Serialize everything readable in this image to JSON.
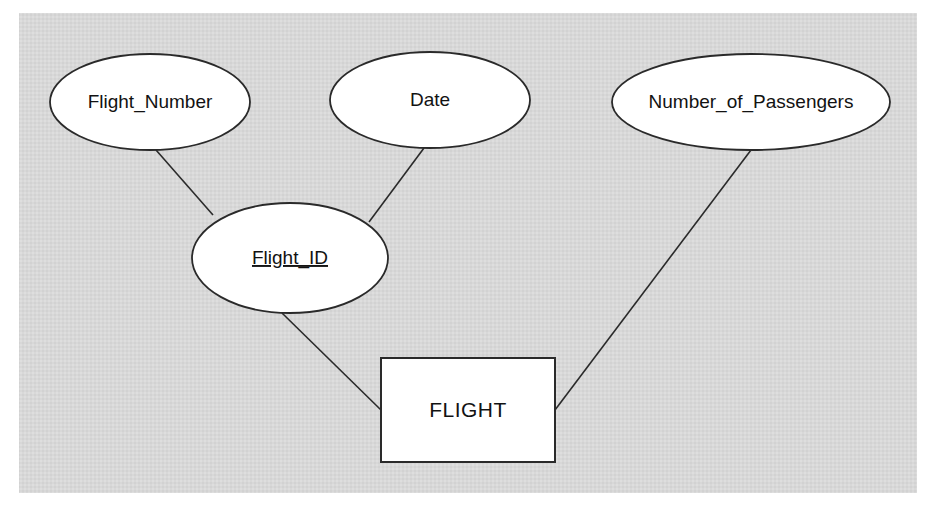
{
  "diagram": {
    "kind": "entity-relationship-diagram",
    "background_color": "#d8d8d8",
    "page_color": "#ffffff",
    "shape_fill": "#ffffff",
    "stroke_color": "#2a2a2a",
    "text_color": "#121212",
    "entities": [
      {
        "id": "flight",
        "name": "FLIGHT",
        "shape": "rectangle",
        "x": 381,
        "y": 358,
        "width": 174,
        "height": 104
      }
    ],
    "attributes": [
      {
        "id": "flight_number",
        "name": "Flight_Number",
        "shape": "ellipse",
        "is_key": false,
        "cx": 150,
        "cy": 102,
        "rx": 100,
        "ry": 48
      },
      {
        "id": "date",
        "name": "Date",
        "shape": "ellipse",
        "is_key": false,
        "cx": 430,
        "cy": 100,
        "rx": 100,
        "ry": 48
      },
      {
        "id": "number_of_passengers",
        "name": "Number_of_Passengers",
        "shape": "ellipse",
        "is_key": false,
        "cx": 751,
        "cy": 102,
        "rx": 139,
        "ry": 48
      },
      {
        "id": "flight_id",
        "name": "Flight_ID",
        "shape": "ellipse",
        "is_key": true,
        "cx": 290,
        "cy": 258,
        "rx": 98,
        "ry": 55
      }
    ],
    "connections": [
      {
        "id": "conn-flight-number-to-flight-id",
        "from": "flight_number",
        "to": "flight_id",
        "x1": 156,
        "y1": 150,
        "x2": 213,
        "y2": 215
      },
      {
        "id": "conn-date-to-flight-id",
        "from": "date",
        "to": "flight_id",
        "x1": 424,
        "y1": 148,
        "x2": 369,
        "y2": 222
      },
      {
        "id": "conn-flight-id-to-flight",
        "from": "flight_id",
        "to": "flight",
        "x1": 282,
        "y1": 313,
        "x2": 381,
        "y2": 410
      },
      {
        "id": "conn-passengers-to-flight",
        "from": "number_of_passengers",
        "to": "flight",
        "x1": 751,
        "y1": 150,
        "x2": 555,
        "y2": 410
      }
    ],
    "panel": {
      "x": 19,
      "y": 13,
      "width": 898,
      "height": 480
    }
  }
}
